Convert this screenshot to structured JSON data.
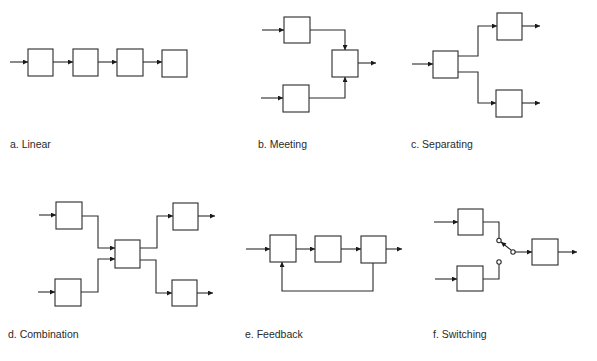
{
  "figure": {
    "panels": [
      {
        "id": "a",
        "label": "a. Linear",
        "blocks": 4,
        "description": "four blocks in series, single input and single output"
      },
      {
        "id": "b",
        "label": "b. Meeting",
        "blocks": 3,
        "description": "two input blocks merge into one output block"
      },
      {
        "id": "c",
        "label": "c. Separating",
        "blocks": 3,
        "description": "one input block splits into two output blocks"
      },
      {
        "id": "d",
        "label": "d. Combination",
        "blocks": 5,
        "description": "two inputs merge into a central block which then separates into two outputs"
      },
      {
        "id": "e",
        "label": "e. Feedback",
        "blocks": 3,
        "description": "three blocks in series with a feedback loop from the last block back to the first"
      },
      {
        "id": "f",
        "label": "f. Switching",
        "blocks": 3,
        "description": "a switch selects one of two input blocks to feed a single output block"
      }
    ]
  },
  "colors": {
    "stroke": "#2a2a2a",
    "background": "#ffffff",
    "text": "#2a2a2a"
  }
}
